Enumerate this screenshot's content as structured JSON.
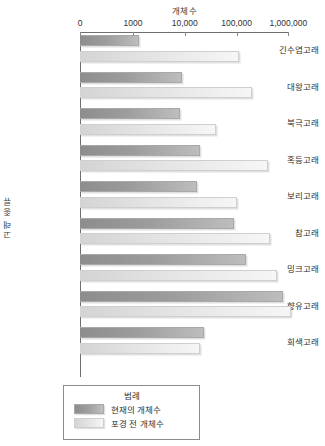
{
  "chart_data": {
    "type": "bar",
    "orientation": "horizontal",
    "title": "개체수",
    "xlabel": "개체수",
    "ylabel": "고래 종류",
    "xscale": "log",
    "xlim": [
      100,
      2000000
    ],
    "grid": false,
    "xticks": [
      {
        "label": "0",
        "value": 0
      },
      {
        "label": "1000",
        "value": 1000
      },
      {
        "label": "10,000",
        "value": 10000
      },
      {
        "label": "100,000",
        "value": 100000
      },
      {
        "label": "1,000,000",
        "value": 1000000
      }
    ],
    "categories": [
      "긴수염고래",
      "대왕고래",
      "북극고래",
      "혹등고래",
      "보리고래",
      "참고래",
      "밍크고래",
      "향유고래",
      "회색고래"
    ],
    "series": [
      {
        "name": "현재의 개체수",
        "color": "#9c9c9c",
        "values": [
          1300,
          9000,
          8000,
          20000,
          17000,
          90000,
          150000,
          800000,
          23000
        ]
      },
      {
        "name": "포경 전 개체수",
        "color": "#e4e4e4",
        "values": [
          110000,
          200000,
          40000,
          400000,
          100000,
          450000,
          600000,
          1100000,
          20000
        ]
      }
    ],
    "legend": {
      "title": "범례",
      "position": "bottom",
      "entries": [
        "현재의 개체수",
        "포경 전 개체수"
      ]
    }
  }
}
